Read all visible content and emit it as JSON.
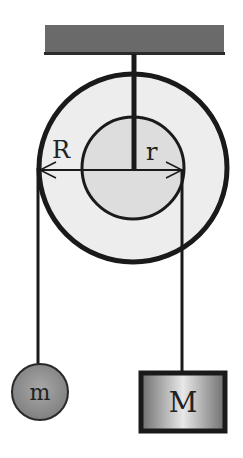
{
  "diagram": {
    "type": "pulley-system",
    "labels": {
      "outer_radius": "R",
      "inner_radius": "r",
      "small_mass": "m",
      "large_mass": "M"
    },
    "colors": {
      "ceiling": "#6a6a6a",
      "outline": "#1a1a1a",
      "pulley_fill": "#ececec",
      "inner_fill": "#dcdcdc",
      "mass_m_fill": "#9a9a9a",
      "mass_M_fill": "#b8b8b8"
    }
  }
}
